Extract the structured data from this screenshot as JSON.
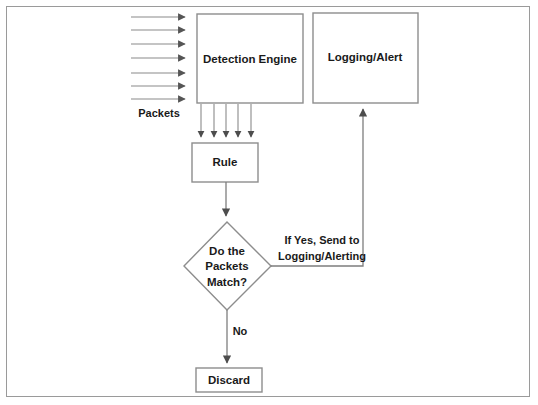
{
  "diagram": {
    "colors": {
      "background": "#ffffff",
      "border": "#9a9a9a",
      "shape_stroke": "#8d8d8d",
      "connector": "#7e7e7e",
      "text": "#1a1a1a"
    },
    "nodes": [
      {
        "id": "detection-engine",
        "label": "Detection Engine",
        "shape": "rectangle"
      },
      {
        "id": "logging-alert",
        "label": "Logging/Alert",
        "shape": "rectangle"
      },
      {
        "id": "rule",
        "label": "Rule",
        "shape": "rectangle"
      },
      {
        "id": "decision",
        "label_lines": [
          "Do the",
          "Packets",
          "Match?"
        ],
        "shape": "diamond"
      },
      {
        "id": "discard",
        "label": "Discard",
        "shape": "rectangle"
      }
    ],
    "labels": {
      "packets": "Packets",
      "decision_line_1": "Do the",
      "decision_line_2": "Packets",
      "decision_line_3": "Match?",
      "yes_line_1": "If Yes, Send to",
      "yes_line_2": "Logging/Alerting",
      "no": "No"
    },
    "edges": [
      {
        "id": "packets-in",
        "from": "packets",
        "to": "detection-engine",
        "count": 7,
        "direction": "right",
        "label": "Packets"
      },
      {
        "id": "engine-to-rule",
        "from": "detection-engine",
        "to": "rule",
        "count": 5,
        "direction": "down"
      },
      {
        "id": "rule-to-decision",
        "from": "rule",
        "to": "decision",
        "direction": "down"
      },
      {
        "id": "decision-yes",
        "from": "decision",
        "to": "logging-alert",
        "direction": "right-up",
        "label": "If Yes, Send to Logging/Alerting"
      },
      {
        "id": "decision-no",
        "from": "decision",
        "to": "discard",
        "direction": "down",
        "label": "No"
      }
    ]
  }
}
